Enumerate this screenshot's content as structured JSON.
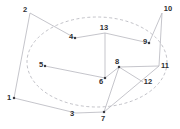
{
  "diagram": {
    "type": "node-link-graph",
    "background": "#ffffff",
    "edge_color": "#b6b6be",
    "ellipse_color": "#b2b2ba",
    "dot_color": "#3c3c42",
    "label_color": "#2e2e32",
    "nodes": [
      {
        "id": "1",
        "x": 14,
        "y": 98,
        "lx": 9,
        "ly": 97,
        "dot": true
      },
      {
        "id": "2",
        "x": 30,
        "y": 13,
        "lx": 25,
        "ly": 9,
        "dot": false
      },
      {
        "id": "3",
        "x": 76,
        "y": 113,
        "lx": 72,
        "ly": 113,
        "dot": false
      },
      {
        "id": "4",
        "x": 75,
        "y": 38,
        "lx": 71,
        "ly": 36,
        "dot": true
      },
      {
        "id": "5",
        "x": 45,
        "y": 66,
        "lx": 41,
        "ly": 64,
        "dot": true
      },
      {
        "id": "6",
        "x": 105,
        "y": 78,
        "lx": 101,
        "ly": 81,
        "dot": true
      },
      {
        "id": "7",
        "x": 104,
        "y": 112,
        "lx": 103,
        "ly": 118,
        "dot": true
      },
      {
        "id": "8",
        "x": 119,
        "y": 67,
        "lx": 117,
        "ly": 61,
        "dot": true
      },
      {
        "id": "9",
        "x": 149,
        "y": 43,
        "lx": 145,
        "ly": 41,
        "dot": true
      },
      {
        "id": "10",
        "x": 162,
        "y": 13,
        "lx": 168,
        "ly": 8,
        "dot": false
      },
      {
        "id": "11",
        "x": 159,
        "y": 66,
        "lx": 165,
        "ly": 65,
        "dot": false
      },
      {
        "id": "12",
        "x": 143,
        "y": 82,
        "lx": 148,
        "ly": 81,
        "dot": false
      },
      {
        "id": "13",
        "x": 105,
        "y": 33,
        "lx": 104,
        "ly": 27,
        "dot": false
      }
    ],
    "edges": [
      [
        "1",
        "2"
      ],
      [
        "1",
        "3"
      ],
      [
        "2",
        "4"
      ],
      [
        "4",
        "13"
      ],
      [
        "13",
        "9"
      ],
      [
        "13",
        "6"
      ],
      [
        "9",
        "10"
      ],
      [
        "10",
        "11"
      ],
      [
        "8",
        "11"
      ],
      [
        "5",
        "6"
      ],
      [
        "6",
        "8"
      ],
      [
        "8",
        "7"
      ],
      [
        "8",
        "12"
      ],
      [
        "7",
        "11"
      ],
      [
        "3",
        "7"
      ]
    ],
    "ellipse": {
      "cx": 97,
      "cy": 62,
      "rx": 70,
      "ry": 45,
      "dash": "3,2.5"
    }
  }
}
